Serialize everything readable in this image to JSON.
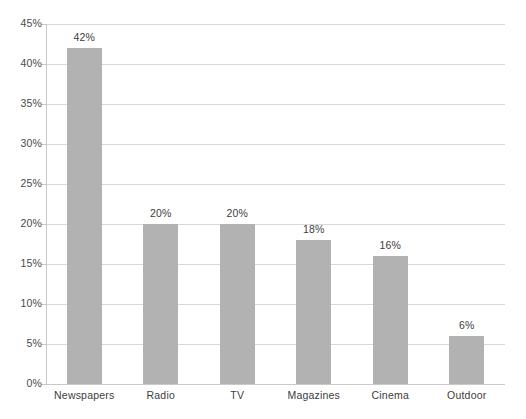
{
  "chart_data": {
    "type": "bar",
    "title": "",
    "subtitle": "",
    "xlabel": "",
    "ylabel": "",
    "categories": [
      "Newspapers",
      "Radio",
      "TV",
      "Magazines",
      "Cinema",
      "Outdoor"
    ],
    "values": [
      42,
      20,
      20,
      18,
      16,
      6
    ],
    "data_labels": [
      "42%",
      "20%",
      "20%",
      "18%",
      "16%",
      "6%"
    ],
    "ylim": [
      0,
      45
    ],
    "ytick_values": [
      0,
      5,
      10,
      15,
      20,
      25,
      30,
      35,
      40,
      45
    ],
    "ytick_labels": [
      "0%",
      "5%",
      "10%",
      "15%",
      "20%",
      "25%",
      "30%",
      "35%",
      "40%",
      "45%"
    ],
    "grid": "horizontal",
    "legend": "none",
    "bar_color": "#b2b2b2",
    "gridline_color": "#d9d9d9",
    "axis_color": "#c9c9c9",
    "label_color": "#3d3d3d",
    "background_color": "#ffffff"
  }
}
